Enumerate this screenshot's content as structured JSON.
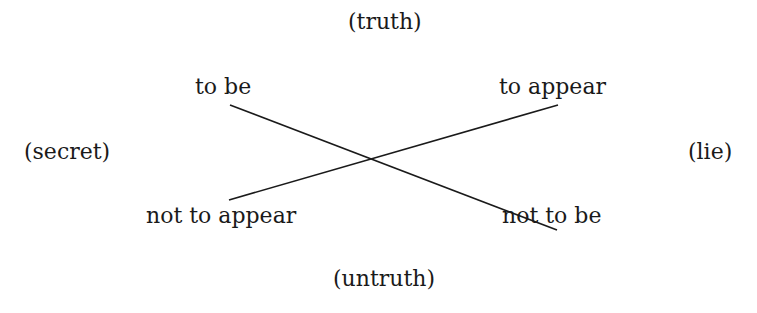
{
  "diagram": {
    "poles": {
      "top": "(truth)",
      "bottom": "(untruth)",
      "left": "(secret)",
      "right": "(lie)"
    },
    "corners": {
      "top_left": "to be",
      "top_right": "to appear",
      "bottom_left": "not to appear",
      "bottom_right": "not to be"
    },
    "lines": [
      {
        "from": "to be",
        "to": "not to be"
      },
      {
        "from": "to appear",
        "to": "not to appear"
      }
    ],
    "line_color": "#1a1a1a"
  }
}
